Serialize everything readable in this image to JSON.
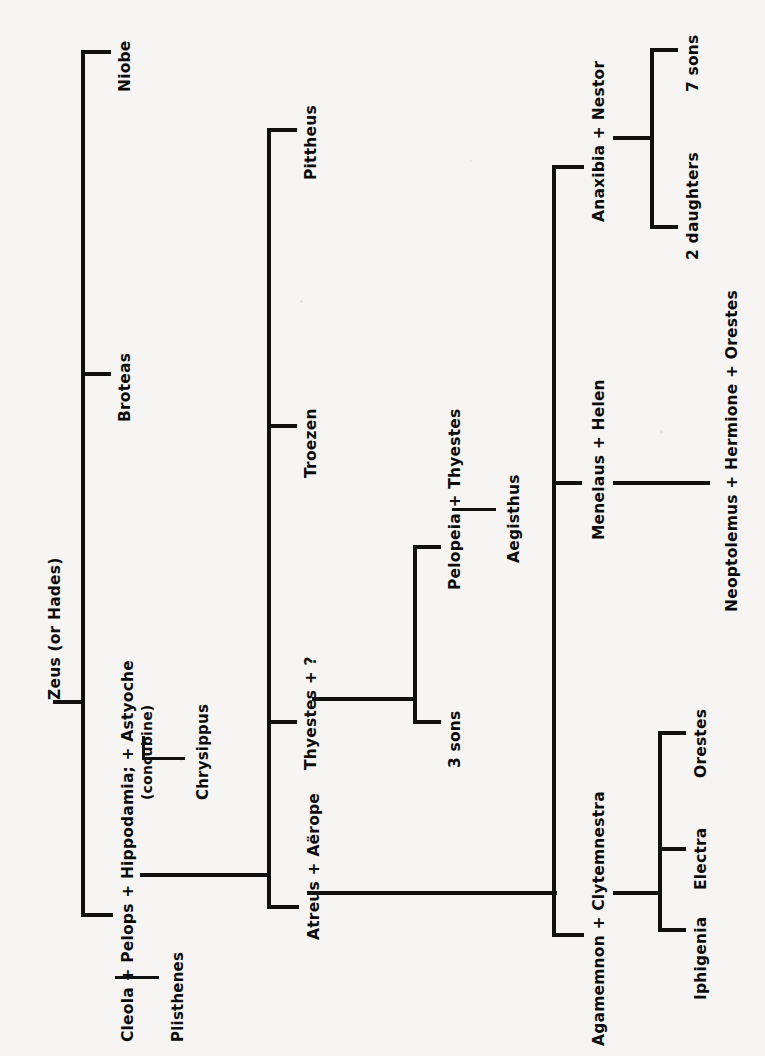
{
  "diagram": {
    "type": "family-tree",
    "orientation": "rotated-90-counterclockwise",
    "line_color": "#111111",
    "background_color": "#f6f5f3",
    "text_color": "#0b0b0b"
  },
  "nodes": {
    "zeus": "Zeus  (or Hades)",
    "niobe": "Niobe",
    "broteas": "Broteas",
    "pelops_union": "Cleola + Pelops + Hippodamia; + Astyoche",
    "pelops_union_l1": "Cleola + Pelops + Hippodamia; + Astyoche",
    "concubine_note": "(concubine)",
    "plisthenes": "Plisthenes",
    "chrysippus": "Chrysippus",
    "pittheus": "Pittheus",
    "troezen": "Troezen",
    "thyestes_q": "Thyestes  +  ?",
    "atreus_aerope": "Atreus  +  Aërope",
    "three_sons": "3 sons",
    "pelopeia_thyestes": "Pelopeia  +  Thyestes",
    "aegisthus": "Aegisthus",
    "anaxibia_nestor": "Anaxibia  +  Nestor",
    "seven_sons": "7 sons",
    "two_daughters": "2 daughters",
    "menelaus_helen": "Menelaus  +  Helen",
    "neoptolemus_line": "Neoptolemus  +  Hermione  +  Orestes",
    "agamemnon_clytemnestra": "Agamemnon  +  Clytemnestra",
    "iphigenia": "Iphigenia",
    "electra": "Electra",
    "orestes": "Orestes"
  }
}
